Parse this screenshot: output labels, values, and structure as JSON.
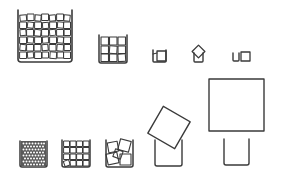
{
  "diagram": {
    "description": "Line drawing of containers filled with cubes of decreasing count and increasing size",
    "colors": {
      "stroke": "#3a3a3a",
      "background": "#ffffff"
    },
    "top_row": [
      {
        "id": "large-container-many-cubes",
        "cubes": "many small"
      },
      {
        "id": "medium-container-9-cubes",
        "cubes": "3x3"
      },
      {
        "id": "small-cup-one-cube",
        "cubes": "1"
      },
      {
        "id": "small-cup-tilted-cube",
        "cubes": "1 tilted"
      },
      {
        "id": "small-cup-cube-beside",
        "cubes": "1 beside"
      }
    ],
    "bottom_row": [
      {
        "id": "container-fine-cubes",
        "cubes": "very many tiny"
      },
      {
        "id": "container-medium-cubes",
        "cubes": "about 20"
      },
      {
        "id": "container-few-cubes",
        "cubes": "about 5 tilted"
      },
      {
        "id": "cup-with-tilted-large-cube",
        "cubes": "1 large tilted"
      },
      {
        "id": "cup-below-huge-cube",
        "cubes": "1 huge"
      }
    ]
  }
}
